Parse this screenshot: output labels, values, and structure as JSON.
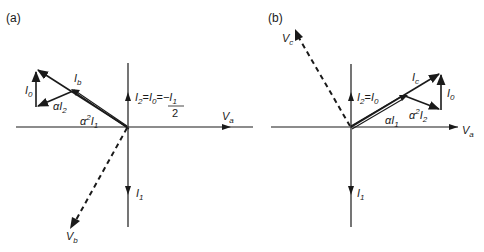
{
  "panels": {
    "a": {
      "label": "(a)",
      "axis_h_label": "V",
      "axis_h_sub": "a",
      "voltage_label": "V",
      "voltage_sub": "b",
      "i1_label": "I",
      "i1_sub": "1",
      "i0_label": "I",
      "i0_sub": "0",
      "ib_label": "I",
      "ib_sub": "b",
      "ai2_prefix": "α",
      "ai2_label": "I",
      "ai2_sub": "2",
      "a2i1_prefix": "α",
      "a2i1_sup": "2",
      "a2i1_label": "I",
      "a2i1_sub": "1",
      "eq_part1": "I",
      "eq_sub1": "2",
      "eq_eq1": "=",
      "eq_part2": "I",
      "eq_sub2": "0",
      "eq_eq2": "=",
      "eq_num": "−I",
      "eq_num_sub": "1",
      "eq_den": "2"
    },
    "b": {
      "label": "(b)",
      "axis_h_label": "V",
      "axis_h_sub": "a",
      "voltage_label": "V",
      "voltage_sub": "c",
      "i1_label": "I",
      "i1_sub": "1",
      "i0_label": "I",
      "i0_sub": "0",
      "ic_label": "I",
      "ic_sub": "c",
      "ai1_prefix": "α",
      "ai1_label": "I",
      "ai1_sub": "1",
      "a2i2_prefix": "α",
      "a2i2_sup": "2",
      "a2i2_label": "I",
      "a2i2_sub": "2",
      "eq_part1": "I",
      "eq_sub1": "2",
      "eq_eq1": "=",
      "eq_part2": "I",
      "eq_sub2": "0"
    }
  },
  "colors": {
    "ink": "#1a1a1a",
    "background": "#ffffff"
  }
}
